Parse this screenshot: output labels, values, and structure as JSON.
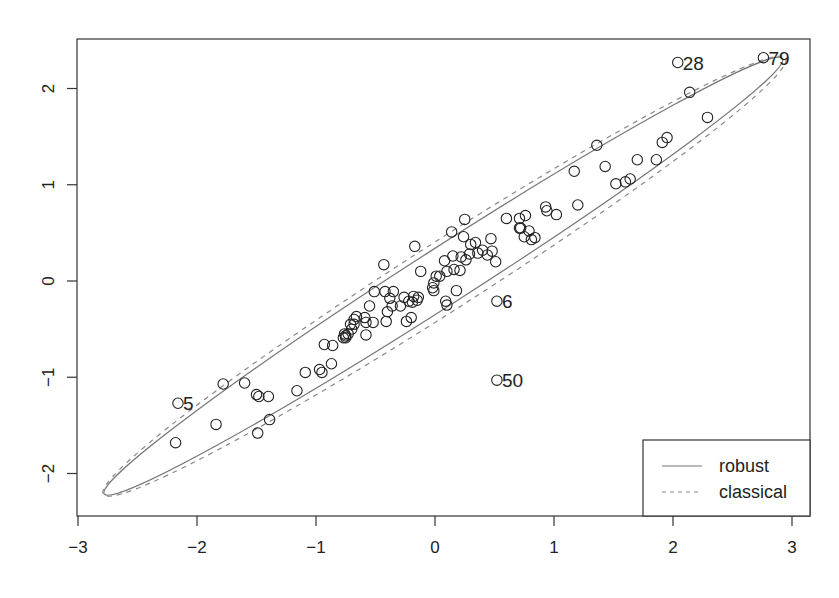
{
  "chart_data": {
    "type": "scatter",
    "title": "",
    "xlabel": "",
    "ylabel": "",
    "xlim": [
      -3.0,
      3.1
    ],
    "ylim": [
      -2.45,
      2.5
    ],
    "x_ticks": [
      -3,
      -2,
      -1,
      0,
      1,
      2,
      3
    ],
    "y_ticks": [
      -2,
      -1,
      0,
      1,
      2
    ],
    "x_tick_labels": [
      "−3",
      "−2",
      "−1",
      "0",
      "1",
      "2",
      "3"
    ],
    "y_tick_labels": [
      "−2",
      "−1",
      "0",
      "1",
      "2"
    ],
    "grid": false,
    "legend": {
      "position": "bottom-right",
      "entries": [
        {
          "label": "robust",
          "linestyle": "solid",
          "color": "#777777"
        },
        {
          "label": "classical",
          "linestyle": "dashed",
          "color": "#888888"
        }
      ]
    },
    "ellipses": [
      {
        "name": "robust",
        "center": [
          0.07,
          0.05
        ],
        "semi_major_px": 403,
        "semi_minor_px": 28,
        "angle_deg": 32.7,
        "linestyle": "solid"
      },
      {
        "name": "classical",
        "center": [
          0.08,
          0.05
        ],
        "semi_major_px": 405,
        "semi_minor_px": 34,
        "angle_deg": 32.6,
        "linestyle": "dashed"
      }
    ],
    "labeled_points": [
      {
        "label": "28",
        "x": 2.04,
        "y": 2.27
      },
      {
        "label": "79",
        "x": 2.76,
        "y": 2.32
      },
      {
        "label": "5",
        "x": -2.16,
        "y": -1.27
      },
      {
        "label": "6",
        "x": 0.52,
        "y": -0.21
      },
      {
        "label": "50",
        "x": 0.52,
        "y": -1.03
      }
    ],
    "points": [
      [
        -2.16,
        -1.27
      ],
      [
        -1.78,
        -1.07
      ],
      [
        -1.6,
        -1.06
      ],
      [
        -1.5,
        -1.18
      ],
      [
        -1.48,
        -1.2
      ],
      [
        -1.4,
        -1.2
      ],
      [
        -1.16,
        -1.14
      ],
      [
        -1.09,
        -0.95
      ],
      [
        -1.84,
        -1.49
      ],
      [
        -2.18,
        -1.68
      ],
      [
        -1.39,
        -1.44
      ],
      [
        -1.49,
        -1.58
      ],
      [
        -0.97,
        -0.92
      ],
      [
        -0.95,
        -0.95
      ],
      [
        -0.87,
        -0.86
      ],
      [
        -0.86,
        -0.67
      ],
      [
        -0.93,
        -0.66
      ],
      [
        -0.76,
        -0.55
      ],
      [
        -0.75,
        -0.57
      ],
      [
        -0.7,
        -0.5
      ],
      [
        -0.68,
        -0.45
      ],
      [
        -0.59,
        -0.38
      ],
      [
        -0.58,
        -0.43
      ],
      [
        -0.52,
        -0.43
      ],
      [
        -0.41,
        -0.42
      ],
      [
        -0.4,
        -0.32
      ],
      [
        -0.24,
        -0.42
      ],
      [
        -0.2,
        -0.38
      ],
      [
        -0.19,
        -0.22
      ],
      [
        -0.29,
        -0.26
      ],
      [
        -0.38,
        -0.18
      ],
      [
        -0.68,
        -0.4
      ],
      [
        -0.66,
        -0.37
      ],
      [
        -0.71,
        -0.45
      ],
      [
        -0.73,
        -0.55
      ],
      [
        -0.75,
        -0.59
      ],
      [
        -0.55,
        -0.26
      ],
      [
        -0.51,
        -0.11
      ],
      [
        -0.42,
        -0.11
      ],
      [
        -0.35,
        -0.11
      ],
      [
        -0.26,
        -0.17
      ],
      [
        -0.22,
        -0.21
      ],
      [
        -0.14,
        -0.17
      ],
      [
        -0.18,
        -0.16
      ],
      [
        -0.15,
        -0.2
      ],
      [
        -0.36,
        -0.26
      ],
      [
        -0.58,
        -0.56
      ],
      [
        -0.77,
        -0.59
      ],
      [
        -0.43,
        0.17
      ],
      [
        -0.12,
        0.1
      ],
      [
        -0.17,
        0.36
      ],
      [
        0.01,
        0.05
      ],
      [
        0.04,
        0.05
      ],
      [
        -0.01,
        -0.02
      ],
      [
        -0.02,
        -0.07
      ],
      [
        -0.01,
        -0.1
      ],
      [
        0.08,
        0.21
      ],
      [
        0.1,
        0.1
      ],
      [
        0.09,
        -0.21
      ],
      [
        0.1,
        -0.25
      ],
      [
        0.16,
        0.12
      ],
      [
        0.15,
        0.26
      ],
      [
        0.21,
        0.11
      ],
      [
        0.22,
        0.25
      ],
      [
        0.26,
        0.22
      ],
      [
        0.24,
        0.46
      ],
      [
        0.25,
        0.64
      ],
      [
        0.14,
        0.51
      ],
      [
        0.3,
        0.38
      ],
      [
        0.34,
        0.4
      ],
      [
        0.4,
        0.32
      ],
      [
        0.47,
        0.44
      ],
      [
        0.48,
        0.31
      ],
      [
        0.51,
        0.2
      ],
      [
        0.44,
        0.27
      ],
      [
        0.29,
        0.28
      ],
      [
        0.36,
        0.29
      ],
      [
        0.18,
        -0.1
      ],
      [
        0.6,
        0.65
      ],
      [
        0.71,
        0.65
      ],
      [
        0.76,
        0.68
      ],
      [
        0.71,
        0.55
      ],
      [
        0.72,
        0.55
      ],
      [
        0.79,
        0.52
      ],
      [
        0.75,
        0.46
      ],
      [
        0.81,
        0.43
      ],
      [
        0.84,
        0.45
      ],
      [
        0.93,
        0.77
      ],
      [
        0.94,
        0.73
      ],
      [
        1.02,
        0.69
      ],
      [
        1.2,
        0.79
      ],
      [
        1.17,
        1.14
      ],
      [
        1.36,
        1.41
      ],
      [
        1.43,
        1.19
      ],
      [
        1.52,
        1.01
      ],
      [
        1.6,
        1.03
      ],
      [
        1.64,
        1.06
      ],
      [
        1.7,
        1.26
      ],
      [
        1.86,
        1.26
      ],
      [
        1.91,
        1.44
      ],
      [
        1.95,
        1.49
      ],
      [
        2.29,
        1.7
      ],
      [
        2.14,
        1.96
      ],
      [
        2.04,
        2.27
      ],
      [
        2.76,
        2.32
      ],
      [
        0.52,
        -0.21
      ],
      [
        0.52,
        -1.03
      ]
    ]
  }
}
